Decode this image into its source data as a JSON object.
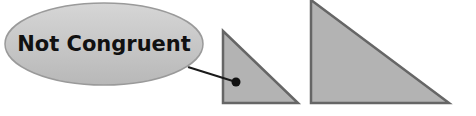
{
  "callout": {
    "label": "Not Congruent",
    "ellipse": {
      "cx": 104,
      "cy": 44,
      "rx": 99,
      "ry": 41
    },
    "line": {
      "x1": 188,
      "y1": 67,
      "x2": 236,
      "y2": 82
    },
    "dot": {
      "cx": 236,
      "cy": 82,
      "r": 4.5
    }
  },
  "shapes": {
    "small_triangle": {
      "points": "223,31 223,103 298,103"
    },
    "large_triangle": {
      "points": "311,0 311,103 449,103"
    }
  },
  "colors": {
    "background": "#ffffff",
    "ellipse_fill_top": "#d4d4d4",
    "ellipse_fill_bottom": "#b9b9b9",
    "ellipse_stroke": "#9a9a9a",
    "triangle_fill": "#b3b3b3",
    "triangle_stroke": "#666666",
    "line": "#1a1a1a",
    "text": "#111111"
  }
}
